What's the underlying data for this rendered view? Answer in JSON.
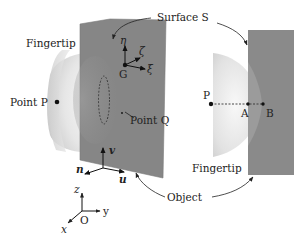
{
  "figure": {
    "type": "diagram"
  },
  "labels": {
    "surface": "Surface S",
    "fingertip_left": "Fingertip",
    "point_p_left": "Point P",
    "point_q": "Point Q",
    "frame_origin_g": "G",
    "eta": "η",
    "zeta": "ζ",
    "xi": "ξ",
    "v": "v",
    "n": "n",
    "u": "u",
    "z": "z",
    "y": "y",
    "x": "x",
    "origin": "O",
    "object": "Object",
    "fingertip_right": "Fingertip",
    "p_right": "P",
    "a": "A",
    "b": "B"
  },
  "colors": {
    "object_fill": "#8a8a8a",
    "object_fill_dark": "#7d7d7d",
    "fingertip_light": "#f2f2f2",
    "fingertip_mid": "#d4d4d4",
    "ink": "#222222"
  }
}
